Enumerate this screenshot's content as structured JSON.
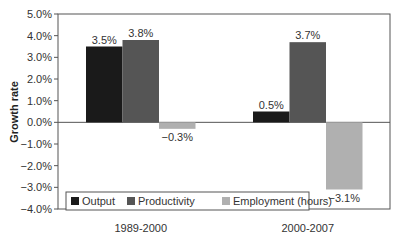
{
  "chart_data": {
    "type": "bar",
    "title": "",
    "xlabel": "",
    "ylabel": "Growth rate",
    "ylim": [
      -4.0,
      5.0
    ],
    "yticks": [
      "5.0%",
      "4.0%",
      "3.0%",
      "2.0%",
      "1.0%",
      "0.0%",
      "-1.0%",
      "-2.0%",
      "-3.0%",
      "-4.0%"
    ],
    "categories": [
      "1989-2000",
      "2000-2007"
    ],
    "series": [
      {
        "name": "Output",
        "color": "#1a1a1a",
        "values": [
          3.5,
          0.5
        ],
        "labels": [
          "3.5%",
          "0.5%"
        ]
      },
      {
        "name": "Productivity",
        "color": "#555555",
        "values": [
          3.8,
          3.7
        ],
        "labels": [
          "3.8%",
          "3.7%"
        ]
      },
      {
        "name": "Employment (hours)",
        "color": "#b0b0b0",
        "values": [
          -0.3,
          -3.1
        ],
        "labels": [
          "−0.3%",
          "−3.1%"
        ]
      }
    ],
    "grid": false,
    "legend_position": "bottom-inside"
  }
}
